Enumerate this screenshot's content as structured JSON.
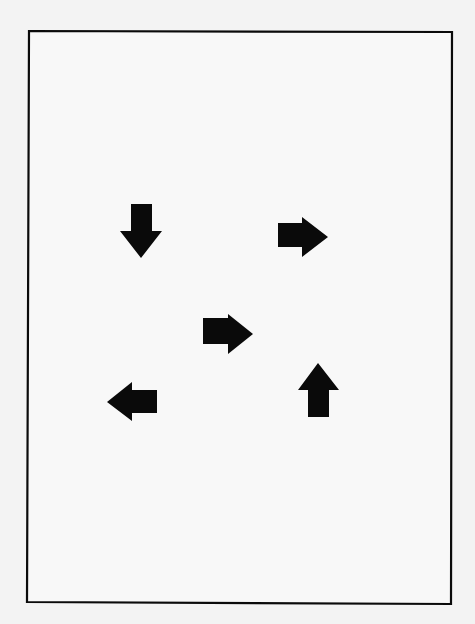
{
  "page": {
    "background": "#f3f3f3",
    "frame_fill": "#f8f8f8",
    "ink": "#0a0a0a"
  },
  "frame": {
    "corners": [
      [
        29,
        31
      ],
      [
        452,
        32
      ],
      [
        451,
        604
      ],
      [
        27,
        602
      ]
    ],
    "stroke_width": 2.2
  },
  "arrows": [
    {
      "name": "arrow-down",
      "direction": "down",
      "points": "131,204 152,204 152,231 162,231 141,258 120,231 131,231"
    },
    {
      "name": "arrow-right-top",
      "direction": "right",
      "points": "278,223 302,223 302,217 328,237 302,257 302,247 278,247"
    },
    {
      "name": "arrow-right-center",
      "direction": "right",
      "points": "203,318 228,318 228,314 253,334 228,354 228,344 203,344"
    },
    {
      "name": "arrow-left",
      "direction": "left",
      "points": "107,402 132,382 132,390 157,390 157,413 132,413 132,421"
    },
    {
      "name": "arrow-up",
      "direction": "up",
      "points": "318,363 339,390 329,390 329,417 308,417 308,390 298,390"
    }
  ]
}
